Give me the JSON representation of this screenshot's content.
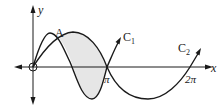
{
  "diagram": {
    "title": "",
    "axes": {
      "x_label": "x",
      "y_label": "y"
    },
    "ticks": {
      "pi": "π",
      "two_pi": "2π"
    },
    "point_label": "A",
    "curves": [
      {
        "name": "C",
        "subscript": "1"
      },
      {
        "name": "C",
        "subscript": "2"
      }
    ],
    "colors": {
      "stroke": "#1a1a1a",
      "shade": "#e6e6e6"
    }
  }
}
